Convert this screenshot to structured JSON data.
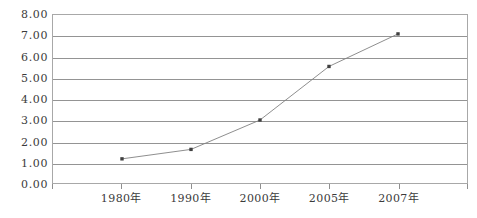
{
  "chart_data": {
    "type": "line",
    "title": "",
    "subtitle": "",
    "xlabel": "",
    "ylabel": "",
    "categories": [
      "1980年",
      "1990年",
      "2000年",
      "2005年",
      "2007年"
    ],
    "values": [
      1.15,
      1.6,
      3.0,
      5.55,
      7.1
    ],
    "series": [
      {
        "name": "",
        "values": [
          1.15,
          1.6,
          3.0,
          5.55,
          7.1
        ]
      }
    ],
    "ylim": [
      0,
      8
    ],
    "ytick_step": 1,
    "ytick_labels": [
      "0.00",
      "1.00",
      "2.00",
      "3.00",
      "4.00",
      "5.00",
      "6.00",
      "7.00",
      "8.00"
    ],
    "ytick_values": [
      0,
      1,
      2,
      3,
      4,
      5,
      6,
      7,
      8
    ],
    "grid": "horizontal",
    "legend": "none",
    "marker": "square",
    "colors": {
      "line": "#808080",
      "marker": "#404040",
      "gridline": "#949494",
      "frame": "#a8a8a8",
      "text": "#3b3b3b",
      "background": "#ffffff"
    }
  }
}
